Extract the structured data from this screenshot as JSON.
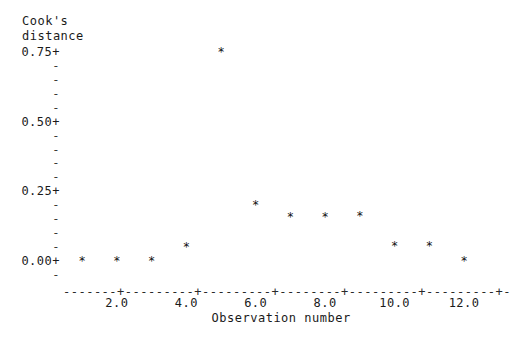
{
  "chart_data": {
    "type": "scatter",
    "title": "",
    "ylabel": "Cook's distance",
    "xlabel": "Observation number",
    "ylabel_lines": [
      "Cook's",
      "distance"
    ],
    "x": [
      1,
      2,
      3,
      4,
      5,
      6,
      7,
      8,
      9,
      10,
      11,
      12
    ],
    "values": [
      0.003,
      0.003,
      0.003,
      0.055,
      0.755,
      0.205,
      0.163,
      0.163,
      0.165,
      0.058,
      0.058,
      0.005
    ],
    "series": [
      {
        "name": "Cook's distance",
        "marker": "*",
        "values": [
          0.003,
          0.003,
          0.003,
          0.055,
          0.755,
          0.205,
          0.163,
          0.163,
          0.165,
          0.058,
          0.058,
          0.005
        ]
      }
    ],
    "xlim": [
      0.45,
      12.4
    ],
    "ylim": [
      -0.035,
      0.79
    ],
    "grid": false,
    "legend": "none",
    "yticks": [
      0.0,
      0.25,
      0.5,
      0.75
    ],
    "ytick_labels": [
      "0.00+",
      "0.25+",
      "0.50+",
      "0.75+"
    ],
    "ytick_minor_glyph": "-",
    "ytick_minor_count_between": 4,
    "xticks": [
      2.0,
      4.0,
      6.0,
      8.0,
      10.0,
      12.0
    ],
    "xtick_labels": [
      "2.0",
      "4.0",
      "6.0",
      "8.0",
      "10.0",
      "12.0"
    ],
    "xtick_glyph": "+",
    "xaxis_fill_glyph": "-",
    "style": "ascii-character-plot"
  },
  "axes": {
    "y_title_line1": "Cook's",
    "y_title_line2": "distance",
    "x_title": "Observation number",
    "y_major": [
      {
        "label": "0.75+",
        "value": 0.75
      },
      {
        "label": "0.50+",
        "value": 0.5
      },
      {
        "label": "0.25+",
        "value": 0.25
      },
      {
        "label": "0.00+",
        "value": 0.0
      }
    ],
    "y_minor_glyph": "-",
    "x_ticks": [
      {
        "label": "2.0",
        "value": 2.0
      },
      {
        "label": "4.0",
        "value": 4.0
      },
      {
        "label": "6.0",
        "value": 6.0
      },
      {
        "label": "8.0",
        "value": 8.0
      },
      {
        "label": "10.0",
        "value": 10.0
      },
      {
        "label": "12.0",
        "value": 12.0
      }
    ]
  },
  "marker": {
    "glyph": "*"
  },
  "colors": {
    "background": "#ffffff",
    "ink": "#1a1a1a",
    "axis": "#2a2a2a"
  }
}
